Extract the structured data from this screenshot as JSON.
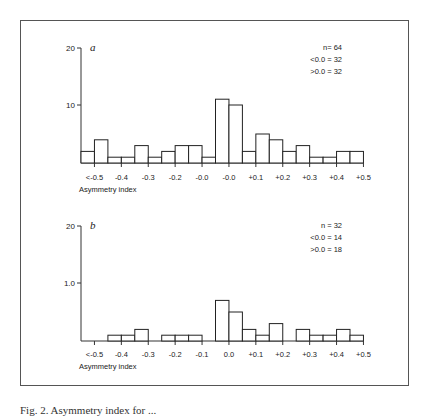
{
  "chart_data": [
    {
      "type": "bar",
      "panel_label": "a",
      "title": "",
      "xlabel": "Asymmetry index",
      "ylabel": "",
      "y_ticks": [
        "20",
        "10"
      ],
      "y_tick_values": [
        20,
        10
      ],
      "x_tick_labels": [
        "<-0.5",
        "-0.4",
        "-0.3",
        "-0.2",
        "-0.0",
        "-0.0",
        "+0.1",
        "+0.2",
        "+0.3",
        "+0.4",
        "+0.5"
      ],
      "bin_width": 0.05,
      "bin_start": -0.55,
      "values": [
        2,
        4,
        1,
        1,
        3,
        1,
        2,
        3,
        3,
        1,
        11,
        10,
        2,
        5,
        4,
        2,
        3,
        1,
        1,
        2,
        2
      ],
      "annotations": [
        "n= 64",
        "<0.0 = 32",
        ">0.0 = 32"
      ],
      "ylim": [
        0,
        20
      ],
      "grid": false
    },
    {
      "type": "bar",
      "panel_label": "b",
      "title": "",
      "xlabel": "Asymmetry index",
      "ylabel": "",
      "y_ticks": [
        "20",
        "1.0"
      ],
      "y_tick_values": [
        20,
        10
      ],
      "x_tick_labels": [
        "<-0.5",
        "-0.4",
        "-0.3",
        "-0.2",
        "-0.1",
        "0.0",
        "+0.1",
        "+0.2",
        "+0.3",
        "+0.4",
        "+0.5"
      ],
      "bin_width": 0.05,
      "bin_start": -0.55,
      "values": [
        0,
        0,
        1,
        1,
        2,
        0,
        1,
        1,
        1,
        0,
        7,
        5,
        2,
        1,
        3,
        0,
        2,
        1,
        1,
        2,
        1
      ],
      "annotations": [
        "n = 32",
        "<0.0 = 14",
        ">0.0 = 18"
      ],
      "ylim": [
        0,
        20
      ],
      "grid": false
    }
  ],
  "caption": "Fig. 2. Asymmetry index for ..."
}
